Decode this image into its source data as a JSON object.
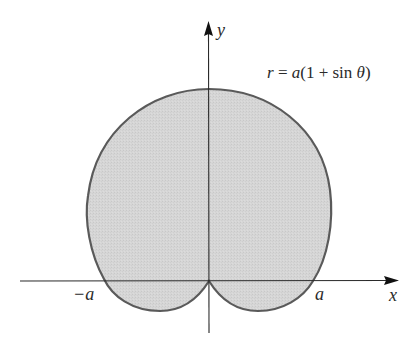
{
  "figure": {
    "equation": {
      "r": "r",
      "eq": " = ",
      "a": "a",
      "rest_open": "(1 + sin ",
      "theta": "θ",
      "rest_close": ")"
    },
    "axes": {
      "x_label": "x",
      "y_label": "y"
    },
    "ticks": {
      "neg_a": "−a",
      "pos_a": "a"
    },
    "colors": {
      "fill": "#d4d4d4",
      "curve": "#5a5a5a",
      "axis": "#2a2a2a"
    }
  }
}
